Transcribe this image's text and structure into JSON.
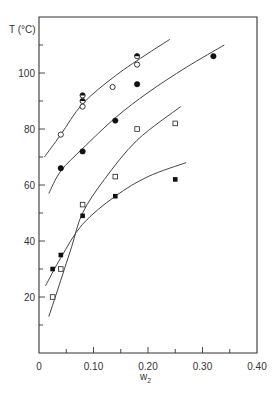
{
  "chart_data": {
    "type": "scatter",
    "title": "",
    "xlabel": "w2",
    "xlabel_main": "w",
    "xlabel_sub": "2",
    "ylabel": "T (°C)",
    "xlim": [
      0,
      0.4
    ],
    "ylim": [
      0,
      120
    ],
    "x_ticks": [
      0,
      0.1,
      0.2,
      0.3,
      0.4
    ],
    "x_tick_labels": [
      "0",
      "0.10",
      "0.20",
      "0.30",
      "0.40"
    ],
    "x_minor_ticks": [
      0.05,
      0.15,
      0.25,
      0.35
    ],
    "y_ticks": [
      20,
      40,
      60,
      80,
      100
    ],
    "y_tick_labels": [
      "20",
      "40",
      "60",
      "80",
      "100"
    ],
    "y_minor_ticks": [
      10,
      30,
      50,
      70,
      90,
      110
    ],
    "grid": false,
    "legend": null,
    "series": [
      {
        "name": "open circles",
        "marker": "open-circle",
        "points": [
          [
            0.04,
            78
          ],
          [
            0.08,
            88
          ],
          [
            0.135,
            95
          ],
          [
            0.18,
            103
          ]
        ]
      },
      {
        "name": "half-filled circles",
        "marker": "half-circle",
        "points": [
          [
            0.08,
            92
          ],
          [
            0.08,
            90
          ],
          [
            0.18,
            106
          ]
        ]
      },
      {
        "name": "filled circles",
        "marker": "filled-circle",
        "points": [
          [
            0.04,
            66
          ],
          [
            0.08,
            72
          ],
          [
            0.14,
            83
          ],
          [
            0.18,
            96
          ],
          [
            0.32,
            106
          ]
        ]
      },
      {
        "name": "open squares",
        "marker": "open-square",
        "points": [
          [
            0.025,
            20
          ],
          [
            0.04,
            30
          ],
          [
            0.08,
            53
          ],
          [
            0.14,
            63
          ],
          [
            0.18,
            80
          ],
          [
            0.25,
            82
          ]
        ]
      },
      {
        "name": "filled squares",
        "marker": "filled-square",
        "points": [
          [
            0.025,
            30
          ],
          [
            0.04,
            35
          ],
          [
            0.08,
            49
          ],
          [
            0.14,
            56
          ],
          [
            0.25,
            62
          ]
        ]
      }
    ],
    "curves": [
      {
        "name": "fit-curve-1",
        "points": [
          [
            0.01,
            70
          ],
          [
            0.04,
            78
          ],
          [
            0.08,
            89
          ],
          [
            0.14,
            99
          ],
          [
            0.2,
            107
          ],
          [
            0.24,
            112
          ]
        ]
      },
      {
        "name": "fit-curve-2",
        "points": [
          [
            0.018,
            57
          ],
          [
            0.04,
            65
          ],
          [
            0.08,
            73
          ],
          [
            0.14,
            84
          ],
          [
            0.2,
            93
          ],
          [
            0.27,
            102
          ],
          [
            0.34,
            110
          ]
        ]
      },
      {
        "name": "fit-curve-3",
        "points": [
          [
            0.018,
            13
          ],
          [
            0.04,
            26
          ],
          [
            0.06,
            38
          ],
          [
            0.08,
            50
          ],
          [
            0.12,
            62
          ],
          [
            0.18,
            76
          ],
          [
            0.26,
            88
          ]
        ]
      },
      {
        "name": "fit-curve-4",
        "points": [
          [
            0.012,
            24
          ],
          [
            0.04,
            34
          ],
          [
            0.08,
            46
          ],
          [
            0.14,
            56
          ],
          [
            0.2,
            63
          ],
          [
            0.27,
            68
          ]
        ]
      }
    ]
  },
  "axes": {
    "ylabel": "T (°C)",
    "xlabel_main": "w",
    "xlabel_sub": "2"
  }
}
